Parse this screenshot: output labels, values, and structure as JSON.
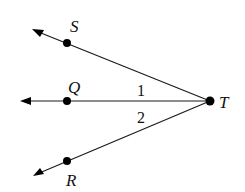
{
  "diagram": {
    "title": "",
    "vertex": {
      "label": "T",
      "x": 210,
      "y": 101
    },
    "points": [
      {
        "label": "S",
        "x": 67,
        "y": 43,
        "label_x": 70,
        "label_y": 32
      },
      {
        "label": "Q",
        "x": 67,
        "y": 101,
        "label_x": 68,
        "label_y": 93
      },
      {
        "label": "R",
        "x": 67,
        "y": 161,
        "label_x": 66,
        "label_y": 186
      }
    ],
    "rays": [
      {
        "name": "ray-TS",
        "from": "T",
        "through": "S",
        "tip_x": 32,
        "tip_y": 29
      },
      {
        "name": "ray-TQ",
        "from": "T",
        "through": "Q",
        "tip_x": 20,
        "tip_y": 101
      },
      {
        "name": "ray-TR",
        "from": "T",
        "through": "R",
        "tip_x": 33,
        "tip_y": 176
      }
    ],
    "angles": [
      {
        "label": "1",
        "between": [
          "TS",
          "TQ"
        ],
        "x": 137,
        "y": 96
      },
      {
        "label": "2",
        "between": [
          "TQ",
          "TR"
        ],
        "x": 137,
        "y": 123
      }
    ],
    "colors": {
      "line": "#1a1a1a",
      "point": "#000000",
      "background": "#ffffff"
    }
  }
}
